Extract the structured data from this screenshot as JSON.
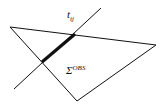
{
  "diagram": {
    "labels": {
      "line": {
        "main": "t",
        "sub": "ij"
      },
      "region": {
        "main": "Σ",
        "sup": "OBS"
      }
    },
    "colors": {
      "stroke": "#111111",
      "background": "#ffffff"
    },
    "shapes": {
      "triangle": [
        [
          10,
          27
        ],
        [
          156,
          45
        ],
        [
          77,
          101
        ]
      ],
      "line": [
        [
          14,
          89
        ],
        [
          101,
          8
        ]
      ],
      "thick_segment": [
        [
          42,
          62
        ],
        [
          75,
          34
        ]
      ]
    }
  }
}
